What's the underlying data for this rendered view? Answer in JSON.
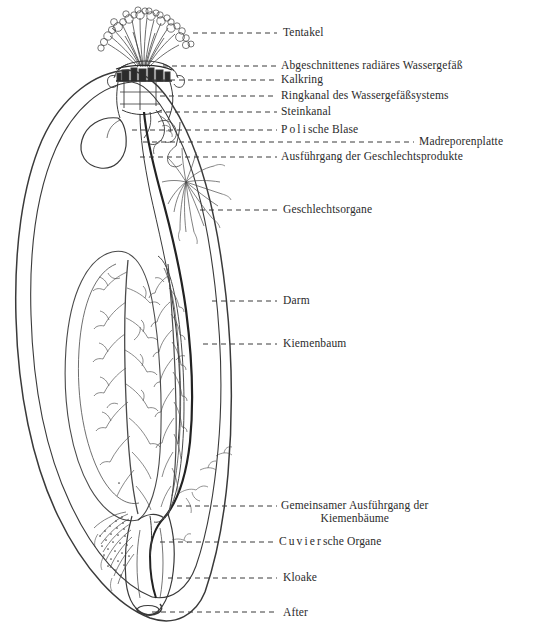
{
  "figure": {
    "type": "anatomical-line-drawing",
    "background_color": "#ffffff",
    "ink_color": "#2b2b2b",
    "leader_line_style": "dashed"
  },
  "labels": [
    {
      "id": "tentakel",
      "text": "Tentakel",
      "x": 283,
      "y": 26,
      "leader": {
        "from_x": 193,
        "from_y": 33,
        "to_x": 277,
        "to_y": 33
      }
    },
    {
      "id": "abgeschnittenes-radiaeres-wassergefaess",
      "text": "Abgeschnittenes radiäres Wassergefäß",
      "x": 281,
      "y": 59,
      "leader": {
        "from_x": 163,
        "from_y": 66,
        "to_x": 277,
        "to_y": 66
      }
    },
    {
      "id": "kalkring",
      "text": "Kalkring",
      "x": 281,
      "y": 73,
      "leader": {
        "from_x": 152,
        "from_y": 80,
        "to_x": 277,
        "to_y": 80
      }
    },
    {
      "id": "ringkanal-des-wassergefaesssystems",
      "text": "Ringkanal des Wassergefäßsystems",
      "x": 281,
      "y": 89,
      "leader": {
        "from_x": 160,
        "from_y": 96,
        "to_x": 277,
        "to_y": 96
      }
    },
    {
      "id": "steinkanal",
      "text": "Steinkanal",
      "x": 281,
      "y": 105,
      "leader": {
        "from_x": 157,
        "from_y": 112,
        "to_x": 277,
        "to_y": 112
      }
    },
    {
      "id": "polische-blase",
      "text_spaced": "Poli",
      "text_rest": "sche Blase",
      "x": 281,
      "y": 123,
      "leader": {
        "from_x": 132,
        "from_y": 130,
        "to_x": 277,
        "to_y": 130
      }
    },
    {
      "id": "madreporenplatte",
      "text": "Madreporenplatte",
      "x": 419,
      "y": 135,
      "leader": {
        "from_x": 143,
        "from_y": 142,
        "to_x": 414,
        "to_y": 142
      }
    },
    {
      "id": "ausfuehrgang-der-geschlechtsprodukte",
      "text": "Ausführgang der Geschlechtsprodukte",
      "x": 281,
      "y": 150,
      "leader": {
        "from_x": 140,
        "from_y": 157,
        "to_x": 277,
        "to_y": 157
      }
    },
    {
      "id": "geschlechtsorgane",
      "text": "Geschlechtsorgane",
      "x": 283,
      "y": 203,
      "leader": {
        "from_x": 200,
        "from_y": 210,
        "to_x": 277,
        "to_y": 210
      }
    },
    {
      "id": "darm",
      "text": "Darm",
      "x": 283,
      "y": 294,
      "leader": {
        "from_x": 212,
        "from_y": 301,
        "to_x": 277,
        "to_y": 301
      }
    },
    {
      "id": "kiemenbaum",
      "text": "Kiemenbaum",
      "x": 283,
      "y": 337,
      "leader": {
        "from_x": 203,
        "from_y": 344,
        "to_x": 277,
        "to_y": 344
      }
    },
    {
      "id": "gemeinsamer-ausfuehrgang-der-kiemenbaeume",
      "text": "Gemeinsamer Ausführgang der",
      "text_line2": "Kiemenbäume",
      "x": 281,
      "y": 499,
      "leader": {
        "from_x": 177,
        "from_y": 506,
        "to_x": 277,
        "to_y": 506
      }
    },
    {
      "id": "cuviersche-organe",
      "text_spaced": "Cuvier",
      "text_rest": "sche Organe",
      "x": 279,
      "y": 535,
      "leader": {
        "from_x": 160,
        "from_y": 542,
        "to_x": 275,
        "to_y": 542
      }
    },
    {
      "id": "kloake",
      "text": "Kloake",
      "x": 283,
      "y": 571,
      "leader": {
        "from_x": 168,
        "from_y": 578,
        "to_x": 277,
        "to_y": 578
      }
    },
    {
      "id": "after",
      "text": "After",
      "x": 283,
      "y": 606,
      "leader": {
        "from_x": 152,
        "from_y": 612,
        "to_x": 277,
        "to_y": 612
      }
    }
  ]
}
